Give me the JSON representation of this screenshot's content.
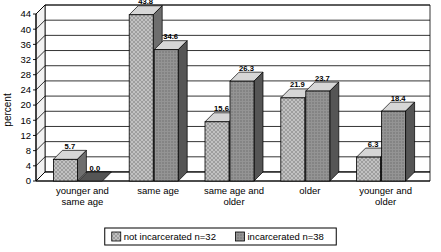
{
  "chart_data": {
    "type": "bar",
    "title": "",
    "xlabel": "",
    "ylabel": "percent",
    "ylim": [
      0,
      44
    ],
    "ytick_step": 4,
    "yticks": [
      "0",
      "4",
      "8",
      "12",
      "16",
      "20",
      "24",
      "28",
      "32",
      "36",
      "40",
      "44"
    ],
    "grid": true,
    "style": "3d-grouped-column",
    "legend_position": "bottom",
    "categories": [
      "younger and same age",
      "same age",
      "same age and older",
      "older",
      "younger and older"
    ],
    "category_lines": [
      [
        "younger and",
        "same age"
      ],
      [
        "same age"
      ],
      [
        "same age and",
        "older"
      ],
      [
        "older"
      ],
      [
        "younger and",
        "older"
      ]
    ],
    "series": [
      {
        "name": "not incarcerated n=32",
        "fill": "#b8b8b8",
        "pattern": "cross-hatch",
        "values": [
          5.7,
          43.8,
          15.6,
          21.9,
          6.3
        ],
        "labels": [
          "5.7",
          "43.8",
          "15.6",
          "21.9",
          "6.3"
        ]
      },
      {
        "name": "incarcerated n=38",
        "fill": "#8f8f8f",
        "pattern": "dotted",
        "values": [
          0.0,
          34.6,
          26.3,
          23.7,
          18.4
        ],
        "labels": [
          "0.0",
          "34.6",
          "26.3",
          "23.7",
          "18.4"
        ]
      }
    ]
  },
  "legend": {
    "items": [
      {
        "label": "not incarcerated n=32",
        "swatch": "#b8b8b8"
      },
      {
        "label": "incarcerated n=38",
        "swatch": "#8f8f8f"
      }
    ]
  },
  "colors": {
    "series1": "#b8b8b8",
    "series2": "#8f8f8f",
    "series1_side": "#6e6e6e",
    "series2_side": "#555555",
    "axis": "#000000",
    "grid": "#000000",
    "plot_background": "#ffffff",
    "wall": "#ffffff"
  }
}
